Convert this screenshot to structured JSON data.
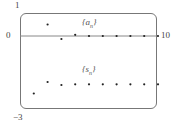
{
  "chart_data": {
    "type": "scatter",
    "title": "",
    "xlabel": "",
    "ylabel": "",
    "xlim": [
      0,
      10
    ],
    "ylim": [
      -3,
      1
    ],
    "grid": false,
    "tick_labels": {
      "y_top": "1",
      "y_zero": "0",
      "y_bottom": "−3",
      "x_right": "10"
    },
    "series": [
      {
        "name": "{a_n}",
        "label_text": "{a",
        "label_sub": "n",
        "x": [
          2,
          3,
          4,
          5,
          6,
          7,
          8,
          9,
          10
        ],
        "values": [
          0.5,
          -0.13,
          0.05,
          0.0,
          0.0,
          0.0,
          0.0,
          0.0,
          0.0
        ]
      },
      {
        "name": "{s_n}",
        "label_text": "{s",
        "label_sub": "n",
        "x": [
          1,
          2,
          3,
          4,
          5,
          6,
          7,
          8,
          9,
          10
        ],
        "values": [
          -2.5,
          -2.0,
          -2.13,
          -2.1,
          -2.1,
          -2.1,
          -2.1,
          -2.1,
          -2.1,
          -2.1
        ]
      }
    ]
  }
}
